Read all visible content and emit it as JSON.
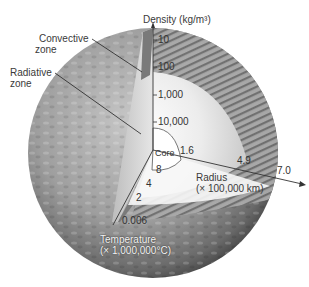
{
  "diagram": {
    "labels": {
      "convective_zone": [
        "Convective",
        "zone"
      ],
      "radiative_zone": [
        "Radiative",
        "zone"
      ],
      "core": "Core"
    },
    "density_axis": {
      "title": "Density (kg/m³)",
      "ticks": [
        "10",
        "100",
        "1,000",
        "10,000"
      ]
    },
    "radius_axis": {
      "title_line1": "Radius",
      "title_line2": "(× 100,000 km)",
      "ticks": [
        "1.6",
        "4.9",
        "7.0"
      ]
    },
    "temperature_axis": {
      "title_line1": "Temperature",
      "title_line2": "(× 1,000,000°C)",
      "ticks": [
        "8",
        "4",
        "2",
        "0.006"
      ]
    },
    "colors": {
      "surface_dark": "#5a5a5a",
      "surface_mid": "#9a9a9a",
      "interior_light": "#f2f2f2",
      "convective_band": "#8c8c8c",
      "axis_line": "#333333"
    }
  }
}
